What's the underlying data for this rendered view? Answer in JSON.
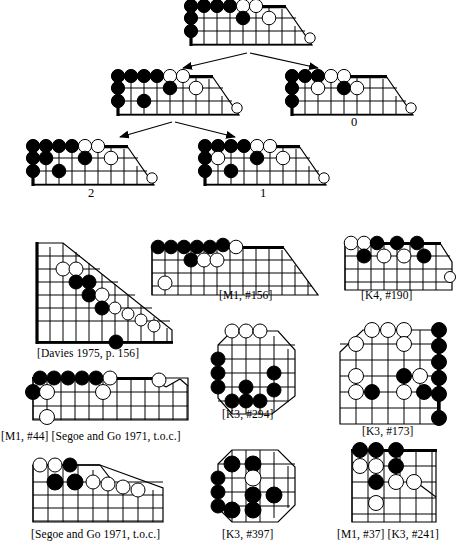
{
  "figure": {
    "type": "go-position-game-tree",
    "colors": {
      "line": "#000000",
      "black_stone": "#000000",
      "white_stone": "#ffffff",
      "background": "#ffffff"
    }
  },
  "tree": {
    "root": {
      "id": "root-position",
      "value_label": ""
    },
    "children": [
      {
        "id": "left-child-position",
        "value_label": ""
      },
      {
        "id": "right-child-position",
        "value_label": "0"
      }
    ],
    "grandchildren": [
      {
        "id": "left-grandchild-position",
        "value_label": "2"
      },
      {
        "id": "right-grandchild-position",
        "value_label": "1"
      }
    ],
    "arrow_count": 4
  },
  "gallery": [
    {
      "id": "position-davies",
      "caption": "[Davies 1975, p. 156]"
    },
    {
      "id": "position-m1-156",
      "caption": "[M1, #156]"
    },
    {
      "id": "position-k4-190",
      "caption": "[K4, #190]"
    },
    {
      "id": "position-k3-294",
      "caption": "[K3, #294]"
    },
    {
      "id": "position-k3-173",
      "caption": "[K3, #173]"
    },
    {
      "id": "position-m1-44",
      "caption": "[M1, #44] [Segoe and Go 1971, t.o.c.]"
    },
    {
      "id": "position-segoe",
      "caption": "[Segoe and Go 1971, t.o.c.]"
    },
    {
      "id": "position-k3-397",
      "caption": "[K3, #397]"
    },
    {
      "id": "position-m1-37",
      "caption": "[M1, #37] [K3, #241]"
    }
  ],
  "labels": {
    "zero": "0",
    "one": "1",
    "two": "2"
  }
}
